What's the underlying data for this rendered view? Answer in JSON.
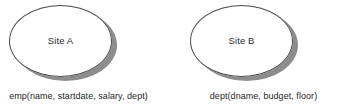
{
  "diagram": {
    "type": "distributed-database-sites",
    "background_color": "#ffffff",
    "outline_color": "#4a4a4a",
    "shadow_color": "#8d8d8d",
    "text_color": "#1f1f1f",
    "sites": [
      {
        "id": "site-a",
        "label": "Site A",
        "relation_caption": "emp(name, startdate, salary, dept)"
      },
      {
        "id": "site-b",
        "label": "Site B",
        "relation_caption": "dept(dname, budget, floor)"
      }
    ]
  }
}
